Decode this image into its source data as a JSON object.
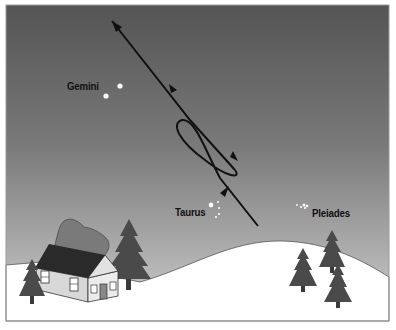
{
  "diagram": {
    "type": "illustration",
    "colors": {
      "sky_top": "#555555",
      "sky_bottom": "#c8c8c8",
      "ground": "#ffffff",
      "trees": "#4a4a4a",
      "roof": "#2a2a2a",
      "path_line": "#111111",
      "stars": "#ffffff",
      "frame": "#999999"
    },
    "labels": {
      "gemini": "Gemini",
      "taurus": "Taurus",
      "pleiades": "Pleiades"
    },
    "elements": {
      "planet_path": "Line with retrograde loop and direction arrows",
      "house": "House with chimney smoke",
      "trees": 5
    }
  }
}
